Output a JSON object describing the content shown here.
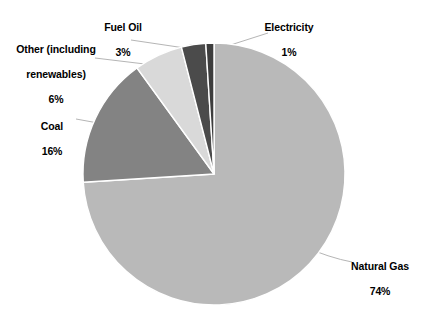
{
  "chart_data": {
    "type": "pie",
    "title": "",
    "subtitle": "",
    "xlabel": "",
    "ylabel": "",
    "legend_position": "none",
    "grid": false,
    "labels_show_percent": true,
    "start_angle_deg": 0,
    "direction": "counterclockwise",
    "categories": [
      "Natural Gas",
      "Coal",
      "Other (including renewables)",
      "Fuel Oil",
      "Electricity"
    ],
    "values": [
      74,
      16,
      6,
      3,
      1
    ],
    "units": "%",
    "slices": [
      {
        "name": "Natural Gas",
        "label": "Natural Gas",
        "value": 74,
        "value_text": "74%",
        "color": "#b9b9b9"
      },
      {
        "name": "Coal",
        "label": "Coal",
        "value": 16,
        "value_text": "16%",
        "color": "#838383"
      },
      {
        "name": "Other",
        "label": "Other (including renewables)",
        "label_line1": "Other (including",
        "label_line2": "renewables)",
        "value": 6,
        "value_text": "6%",
        "color": "#d9d9d9"
      },
      {
        "name": "Fuel Oil",
        "label": "Fuel Oil",
        "value": 3,
        "value_text": "3%",
        "color": "#4b4b4b"
      },
      {
        "name": "Electricity",
        "label": "Electricity",
        "value": 1,
        "value_text": "1%",
        "color": "#3d3d3d"
      }
    ],
    "colors": {
      "natural_gas": "#b9b9b9",
      "coal": "#838383",
      "other": "#d9d9d9",
      "fuel_oil": "#4b4b4b",
      "electricity": "#3d3d3d",
      "background": "#ffffff",
      "text": "#000000",
      "leader_line": "#b0b0b0"
    }
  }
}
